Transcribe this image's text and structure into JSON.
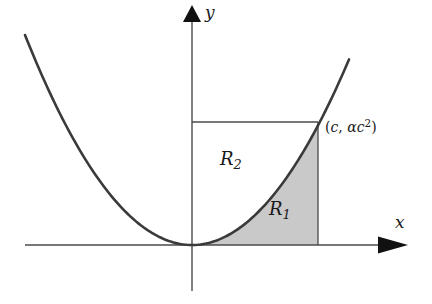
{
  "figure": {
    "type": "math-diagram",
    "background_color": "#ffffff",
    "curve_color": "#3a3a3a",
    "axis_color": "#444444",
    "shade_color": "#c9c9c9",
    "shade_border_color": "#555555",
    "text_color": "#1a1a1a"
  },
  "axes": {
    "x_label": "x",
    "y_label": "y",
    "origin": {
      "x": 192,
      "y": 245
    },
    "x_axis": {
      "start_x": 25,
      "end_x": 408,
      "y": 245,
      "arrow": "right"
    },
    "y_axis": {
      "x": 192,
      "top_y": 5,
      "bottom_y": 291,
      "arrow": "up"
    }
  },
  "curve": {
    "name": "parabola",
    "equation": "y = alpha x^2",
    "coefficient_alpha": 0.00753,
    "vertex": {
      "x": 192,
      "y": 245
    },
    "left_end": {
      "x": 25,
      "y": 35
    },
    "right_end": {
      "x": 349,
      "y": 35
    },
    "stroke_width": 2.6
  },
  "rectangle": {
    "name": "bounding-rectangle",
    "left": 192,
    "right": 318,
    "top": 122,
    "bottom": 245,
    "stroke_width": 1.2
  },
  "regions": [
    {
      "id": "R1",
      "label": "R",
      "subscript": "1",
      "shaded": true,
      "position": "below the parabola inside the rectangle",
      "fill": "#c9c9c9"
    },
    {
      "id": "R2",
      "label": "R",
      "subscript": "2",
      "shaded": false,
      "position": "above the parabola inside the rectangle",
      "fill": "#ffffff"
    }
  ],
  "point_label": {
    "open_paren": "(",
    "x_value": "c",
    "separator": ", ",
    "alpha": "α",
    "c": "c",
    "exponent": "2",
    "close_paren": ")",
    "full_text": "(c, αc2)"
  }
}
